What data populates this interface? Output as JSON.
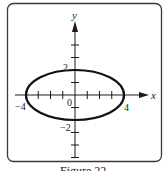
{
  "figure": {
    "caption": "Figure 22"
  },
  "chart_data": {
    "type": "line",
    "title": "",
    "equation": "x^2/16 + y^2/4 = 1",
    "xlabel": "x",
    "ylabel": "y",
    "xlim": [
      -4.8,
      5.8
    ],
    "ylim": [
      -5,
      6
    ],
    "grid": false,
    "legend": null,
    "x_tick_values": [
      -4,
      -3,
      -2,
      -1,
      1,
      2,
      3,
      4
    ],
    "y_tick_values": [
      -5,
      -4,
      -3,
      -2,
      -1,
      1,
      2,
      3,
      4
    ],
    "tick_labels": {
      "x": [
        {
          "value": -4,
          "label": "−4"
        },
        {
          "value": 4,
          "label": "4"
        }
      ],
      "y": [
        {
          "value": 2,
          "label": "2"
        },
        {
          "value": -2,
          "label": "−2"
        }
      ],
      "origin": "0"
    },
    "series": [
      {
        "name": "ellipse",
        "center": [
          0,
          0
        ],
        "semi_major_x": 4,
        "semi_minor_y": 2,
        "key_points": [
          {
            "x": -4,
            "y": 0
          },
          {
            "x": 4,
            "y": 0
          },
          {
            "x": 0,
            "y": 2
          },
          {
            "x": 0,
            "y": -2
          }
        ]
      }
    ]
  }
}
